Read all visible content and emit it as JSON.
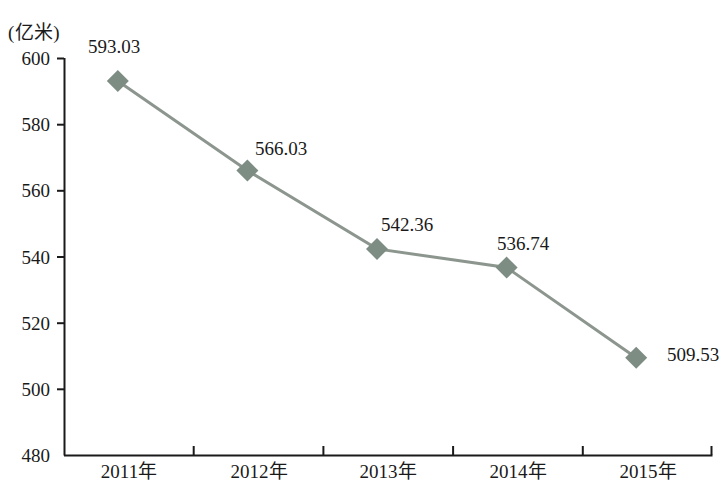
{
  "chart_data": {
    "type": "line",
    "title": "",
    "subtitle": "",
    "xlabel": "",
    "ylabel": "(亿米)",
    "unit_label": "(亿米)",
    "categories": [
      "2011年",
      "2012年",
      "2013年",
      "2014年",
      "2015年"
    ],
    "values": [
      593.03,
      566.03,
      542.36,
      536.74,
      509.53
    ],
    "point_labels": [
      "593.03",
      "566.03",
      "542.36",
      "536.74",
      "509.53"
    ],
    "ylim": [
      480,
      600
    ],
    "yticks": [
      480,
      500,
      520,
      540,
      560,
      580,
      600
    ],
    "ytick_labels": [
      "480",
      "500",
      "520",
      "540",
      "560",
      "580",
      "600"
    ],
    "grid": false,
    "legend": false,
    "legend_position": "none",
    "series": [
      {
        "name": "",
        "values": [
          593.03,
          566.03,
          542.36,
          536.74,
          509.53
        ],
        "marker": "diamond",
        "line_color": "#8c968f",
        "marker_color": "#7e8d84"
      }
    ],
    "colors": {
      "line": "#8c968f",
      "marker": "#7e8d84",
      "axis": "#1a1a1a",
      "text": "#1a1a1a",
      "background": "#ffffff"
    }
  }
}
